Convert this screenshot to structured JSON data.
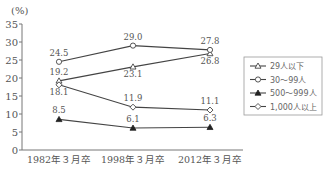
{
  "chart_data": {
    "type": "line",
    "title": "",
    "ylabel": "(%)",
    "xlabel": "",
    "ylim": [
      0,
      35
    ],
    "yticks": [
      0,
      5,
      10,
      15,
      20,
      25,
      30,
      35
    ],
    "categories": [
      "1982年３月卒",
      "1998年３月卒",
      "2012年３月卒"
    ],
    "grid": false,
    "legend_position": "right",
    "series": [
      {
        "name": "29人以下",
        "marker": "triangle-open",
        "values": [
          19.2,
          23.1,
          26.8
        ],
        "labels": [
          "19.2",
          "23.1",
          "26.8"
        ]
      },
      {
        "name": "30～99人",
        "marker": "circle-open",
        "values": [
          24.5,
          29.0,
          27.8
        ],
        "labels": [
          "24.5",
          "29.0",
          "27.8"
        ]
      },
      {
        "name": "500～999人",
        "marker": "triangle-filled",
        "values": [
          8.5,
          6.1,
          6.3
        ],
        "labels": [
          "8.5",
          "6.1",
          "6.3"
        ]
      },
      {
        "name": "1,000人以上",
        "marker": "diamond-open",
        "values": [
          18.1,
          11.9,
          11.1
        ],
        "labels": [
          "18.1",
          "11.9",
          "11.1"
        ]
      }
    ]
  },
  "colors": {
    "line": "#444444",
    "axis": "#777777",
    "text": "#555555"
  }
}
